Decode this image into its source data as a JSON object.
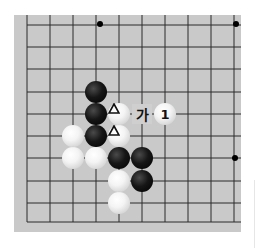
{
  "diagram": {
    "type": "go-board-section",
    "grid": {
      "columns": 10,
      "rows": 10,
      "edges": {
        "left": true,
        "bottom": true,
        "top": false,
        "right": false
      }
    },
    "colors": {
      "board": "#c9c9c9",
      "line": "#2a2a2a",
      "black_stone": "#000000",
      "white_stone": "#ffffff"
    },
    "star_points": [
      {
        "col": 3,
        "row": 0
      },
      {
        "col": 9,
        "row": 0
      },
      {
        "col": 9,
        "row": 6
      }
    ],
    "stones": [
      {
        "color": "black",
        "col": 3,
        "row": 3,
        "mark": ""
      },
      {
        "color": "black",
        "col": 3,
        "row": 4,
        "mark": ""
      },
      {
        "color": "white",
        "col": 4,
        "row": 4,
        "mark": "triangle"
      },
      {
        "color": "white",
        "col": 6,
        "row": 4,
        "mark": "1"
      },
      {
        "color": "white",
        "col": 2,
        "row": 5,
        "mark": ""
      },
      {
        "color": "black",
        "col": 3,
        "row": 5,
        "mark": ""
      },
      {
        "color": "white",
        "col": 4,
        "row": 5,
        "mark": "triangle"
      },
      {
        "color": "white",
        "col": 2,
        "row": 6,
        "mark": ""
      },
      {
        "color": "white",
        "col": 3,
        "row": 6,
        "mark": ""
      },
      {
        "color": "black",
        "col": 4,
        "row": 6,
        "mark": ""
      },
      {
        "color": "black",
        "col": 5,
        "row": 6,
        "mark": ""
      },
      {
        "color": "white",
        "col": 4,
        "row": 7,
        "mark": ""
      },
      {
        "color": "black",
        "col": 5,
        "row": 7,
        "mark": ""
      },
      {
        "color": "white",
        "col": 4,
        "row": 8,
        "mark": ""
      }
    ],
    "labels": [
      {
        "text": "가",
        "col": 5,
        "row": 4
      }
    ],
    "move_labels": {
      "move_1": "1",
      "point_ga": "가"
    }
  }
}
